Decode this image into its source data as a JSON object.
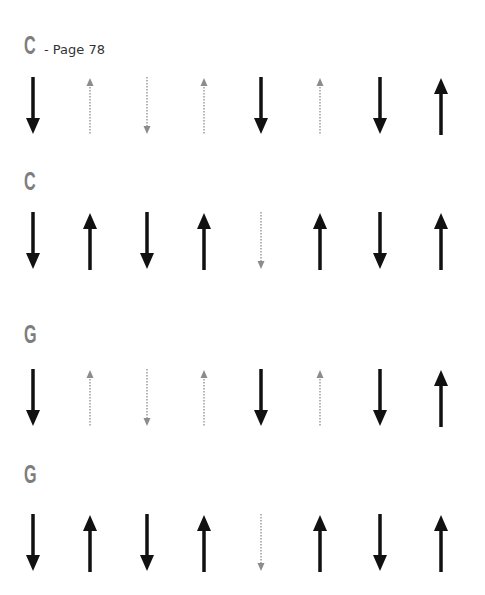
{
  "sections": [
    {
      "chord": "C",
      "page_ref": "- Page 78",
      "strums": [
        {
          "dir": "down",
          "style": "solid"
        },
        {
          "dir": "up",
          "style": "ghost"
        },
        {
          "dir": "down",
          "style": "ghost"
        },
        {
          "dir": "up",
          "style": "ghost"
        },
        {
          "dir": "down",
          "style": "solid"
        },
        {
          "dir": "up",
          "style": "ghost"
        },
        {
          "dir": "down",
          "style": "solid"
        },
        {
          "dir": "up",
          "style": "solid"
        }
      ]
    },
    {
      "chord": "C",
      "page_ref": "",
      "strums": [
        {
          "dir": "down",
          "style": "solid"
        },
        {
          "dir": "up",
          "style": "solid"
        },
        {
          "dir": "down",
          "style": "solid"
        },
        {
          "dir": "up",
          "style": "solid"
        },
        {
          "dir": "down",
          "style": "ghost"
        },
        {
          "dir": "up",
          "style": "solid"
        },
        {
          "dir": "down",
          "style": "solid"
        },
        {
          "dir": "up",
          "style": "solid"
        }
      ]
    },
    {
      "chord": "G",
      "page_ref": "",
      "strums": [
        {
          "dir": "down",
          "style": "solid"
        },
        {
          "dir": "up",
          "style": "ghost"
        },
        {
          "dir": "down",
          "style": "ghost"
        },
        {
          "dir": "up",
          "style": "ghost"
        },
        {
          "dir": "down",
          "style": "solid"
        },
        {
          "dir": "up",
          "style": "ghost"
        },
        {
          "dir": "down",
          "style": "solid"
        },
        {
          "dir": "up",
          "style": "solid"
        }
      ]
    },
    {
      "chord": "G",
      "page_ref": "",
      "strums": [
        {
          "dir": "down",
          "style": "solid"
        },
        {
          "dir": "up",
          "style": "solid"
        },
        {
          "dir": "down",
          "style": "solid"
        },
        {
          "dir": "up",
          "style": "solid"
        },
        {
          "dir": "down",
          "style": "ghost"
        },
        {
          "dir": "up",
          "style": "solid"
        },
        {
          "dir": "down",
          "style": "solid"
        },
        {
          "dir": "up",
          "style": "solid"
        }
      ]
    }
  ],
  "colors": {
    "solid": "#111111",
    "ghost": "#8c8c8c",
    "chord_letter": "#7d7d7d",
    "page_ref": "#333333"
  }
}
